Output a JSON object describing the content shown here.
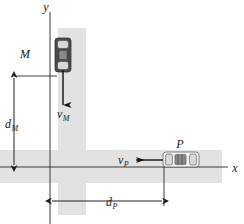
{
  "figure": {
    "type": "kinematics-diagram",
    "width": 244,
    "height": 224,
    "background_color": "#ffffff",
    "road_color": "#e2e2e2"
  },
  "axes": {
    "y_label": "y",
    "x_label": "x",
    "origin_label": "",
    "color": "#3b3b3b",
    "y_axis": {
      "x": 50,
      "y_top": 12,
      "y_bottom": 224
    },
    "x_axis": {
      "y": 167,
      "x_left": 0,
      "x_right": 228
    }
  },
  "roads": {
    "vertical": {
      "x": 58,
      "y": 28,
      "width": 28,
      "height": 187,
      "label": "vertical-road"
    },
    "horizontal": {
      "x": 0,
      "y": 150,
      "width": 222,
      "height": 33,
      "label": "horizontal-road"
    }
  },
  "vehicles": [
    {
      "id": "car-m",
      "label": "M",
      "label_x": 25,
      "label_y": 58,
      "orientation": "vertical",
      "color": "#4a4a4a",
      "x": 55,
      "y": 38,
      "width": 16,
      "height": 34
    },
    {
      "id": "car-p",
      "label": "P",
      "label_x": 180,
      "label_y": 148,
      "orientation": "horizontal",
      "color": "#f4f4f4",
      "x": 163,
      "y": 152,
      "width": 36,
      "height": 15
    }
  ],
  "velocities": [
    {
      "id": "velocity-m",
      "label": "v",
      "subscript": "M",
      "direction": "down",
      "label_x": 57,
      "label_y": 118,
      "line": {
        "x1": 63,
        "y1": 70,
        "x2": 63,
        "y2": 105
      }
    },
    {
      "id": "velocity-p",
      "label": "v",
      "subscript": "P",
      "direction": "left",
      "label_x": 122,
      "label_y": 167,
      "line": {
        "x1": 163,
        "y1": 160,
        "x2": 136,
        "y2": 160
      }
    }
  ],
  "dimensions": [
    {
      "id": "dimension-dm",
      "label": "d",
      "subscript": "M",
      "orientation": "vertical",
      "label_x": 9,
      "label_y": 128,
      "line": {
        "x1": 14,
        "y1": 76,
        "x2": 14,
        "y2": 167
      },
      "extension_from": {
        "x1": 14,
        "y1": 76,
        "x2": 57,
        "y2": 76
      }
    },
    {
      "id": "dimension-dp",
      "label": "d",
      "subscript": "P",
      "orientation": "horizontal",
      "label_x": 114,
      "label_y": 206,
      "line": {
        "x1": 50,
        "y1": 201,
        "x2": 164,
        "y2": 201
      },
      "extension_from": {
        "x1": 164,
        "y1": 167,
        "x2": 164,
        "y2": 206
      }
    }
  ]
}
